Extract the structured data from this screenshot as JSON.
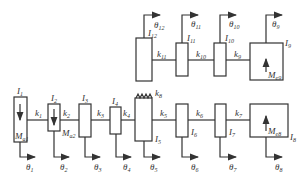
{
  "diagram": {
    "type": "torsional-vibration lumped-mass model",
    "top_row": {
      "inertias": [
        {
          "name": "I",
          "sub": "12",
          "theta": "θ",
          "theta_sub": "12"
        },
        {
          "name": "I",
          "sub": "11",
          "theta": "θ",
          "theta_sub": "11"
        },
        {
          "name": "I",
          "sub": "10",
          "theta": "θ",
          "theta_sub": "10"
        },
        {
          "name": "I",
          "sub": "9",
          "theta": "θ",
          "theta_sub": "9",
          "moment": "M",
          "moment_sub": "e9"
        }
      ],
      "stiffnesses": [
        {
          "name": "k",
          "sub": "11"
        },
        {
          "name": "k",
          "sub": "10"
        },
        {
          "name": "k",
          "sub": "9"
        }
      ]
    },
    "bottom_row": {
      "inertias": [
        {
          "name": "I",
          "sub": "1",
          "theta": "θ",
          "theta_sub": "1",
          "moment": "M",
          "moment_sub": "a1"
        },
        {
          "name": "I",
          "sub": "2",
          "theta": "θ",
          "theta_sub": "2",
          "moment": "M",
          "moment_sub": "a2"
        },
        {
          "name": "I",
          "sub": "3",
          "theta": "θ",
          "theta_sub": "3"
        },
        {
          "name": "I",
          "sub": "4",
          "theta": "θ",
          "theta_sub": "4"
        },
        {
          "name": "I",
          "sub": "5",
          "theta": "θ",
          "theta_sub": "5"
        },
        {
          "name": "I",
          "sub": "6",
          "theta": "θ",
          "theta_sub": "6"
        },
        {
          "name": "I",
          "sub": "7",
          "theta": "θ",
          "theta_sub": "7"
        },
        {
          "name": "I",
          "sub": "8",
          "theta": "θ",
          "theta_sub": "8",
          "moment": "M",
          "moment_sub": "e8"
        }
      ],
      "stiffnesses": [
        {
          "name": "k",
          "sub": "1"
        },
        {
          "name": "k",
          "sub": "2"
        },
        {
          "name": "k",
          "sub": "3"
        },
        {
          "name": "k",
          "sub": "4"
        },
        {
          "name": "k",
          "sub": "5"
        },
        {
          "name": "k",
          "sub": "6"
        },
        {
          "name": "k",
          "sub": "7"
        }
      ],
      "coupling_spring": {
        "name": "k",
        "sub": "8"
      }
    }
  }
}
